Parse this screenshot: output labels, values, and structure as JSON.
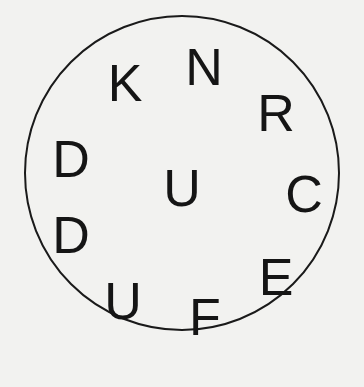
{
  "puzzle": {
    "letters": [
      {
        "char": "N",
        "x": 204,
        "y": 67
      },
      {
        "char": "K",
        "x": 125,
        "y": 83
      },
      {
        "char": "R",
        "x": 276,
        "y": 113
      },
      {
        "char": "D",
        "x": 71,
        "y": 159
      },
      {
        "char": "U",
        "x": 182,
        "y": 188
      },
      {
        "char": "C",
        "x": 304,
        "y": 194
      },
      {
        "char": "D",
        "x": 71,
        "y": 235
      },
      {
        "char": "E",
        "x": 276,
        "y": 277
      },
      {
        "char": "U",
        "x": 123,
        "y": 301
      },
      {
        "char": "F",
        "x": 205,
        "y": 317
      }
    ]
  }
}
